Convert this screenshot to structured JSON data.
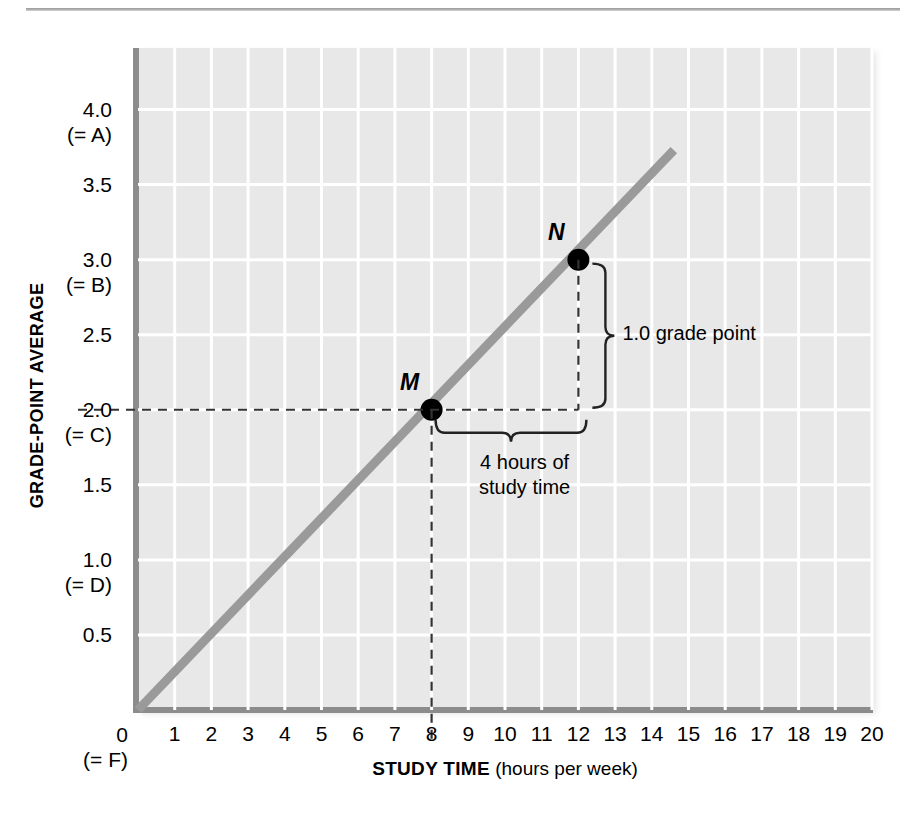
{
  "chart_data": {
    "type": "line",
    "title": "",
    "xlabel_bold": "STUDY TIME",
    "xlabel_rest": " (hours per week)",
    "ylabel": "GRADE-POINT AVERAGE",
    "xlim": [
      0,
      20
    ],
    "ylim": [
      0,
      4.41
    ],
    "grid": true,
    "legend": "none",
    "x_ticks": [
      "1",
      "2",
      "3",
      "4",
      "5",
      "6",
      "7",
      "8",
      "9",
      "10",
      "11",
      "12",
      "13",
      "14",
      "15",
      "16",
      "17",
      "18",
      "19",
      "20"
    ],
    "x_tick_values": [
      1,
      2,
      3,
      4,
      5,
      6,
      7,
      8,
      9,
      10,
      11,
      12,
      13,
      14,
      15,
      16,
      17,
      18,
      19,
      20
    ],
    "x_zero_label": "0\n(= F)",
    "y_ticks": [
      {
        "value": 4.0,
        "label": "4.0\n(= A)"
      },
      {
        "value": 3.5,
        "label": "3.5"
      },
      {
        "value": 3.0,
        "label": "3.0\n(= B)"
      },
      {
        "value": 2.5,
        "label": "2.5"
      },
      {
        "value": 2.0,
        "label": "2.0\n(= C)"
      },
      {
        "value": 1.5,
        "label": "1.5"
      },
      {
        "value": 1.0,
        "label": "1.0\n(= D)"
      },
      {
        "value": 0.5,
        "label": "0.5"
      }
    ],
    "series": [
      {
        "name": "GPA vs study time",
        "color": "#9a9a9a",
        "x": [
          0,
          14.6
        ],
        "y": [
          0,
          3.73
        ],
        "slope": 0.25,
        "intercept": 0
      }
    ],
    "points": [
      {
        "label": "M",
        "x": 8,
        "y": 2.0
      },
      {
        "label": "N",
        "x": 12,
        "y": 3.0
      }
    ],
    "annotations": [
      {
        "name": "rise",
        "text": "1.0 grade point",
        "value": 1.0,
        "unit": "grade point"
      },
      {
        "name": "run",
        "text": "4 hours of\nstudy time",
        "value": 4,
        "unit": "hours"
      }
    ]
  },
  "colors": {
    "plot_background": "#e8e8e8",
    "gridline": "#ffffff",
    "axis": "#8c8c8c",
    "line": "#9a9a9a",
    "point": "#000000",
    "text": "#000000"
  }
}
